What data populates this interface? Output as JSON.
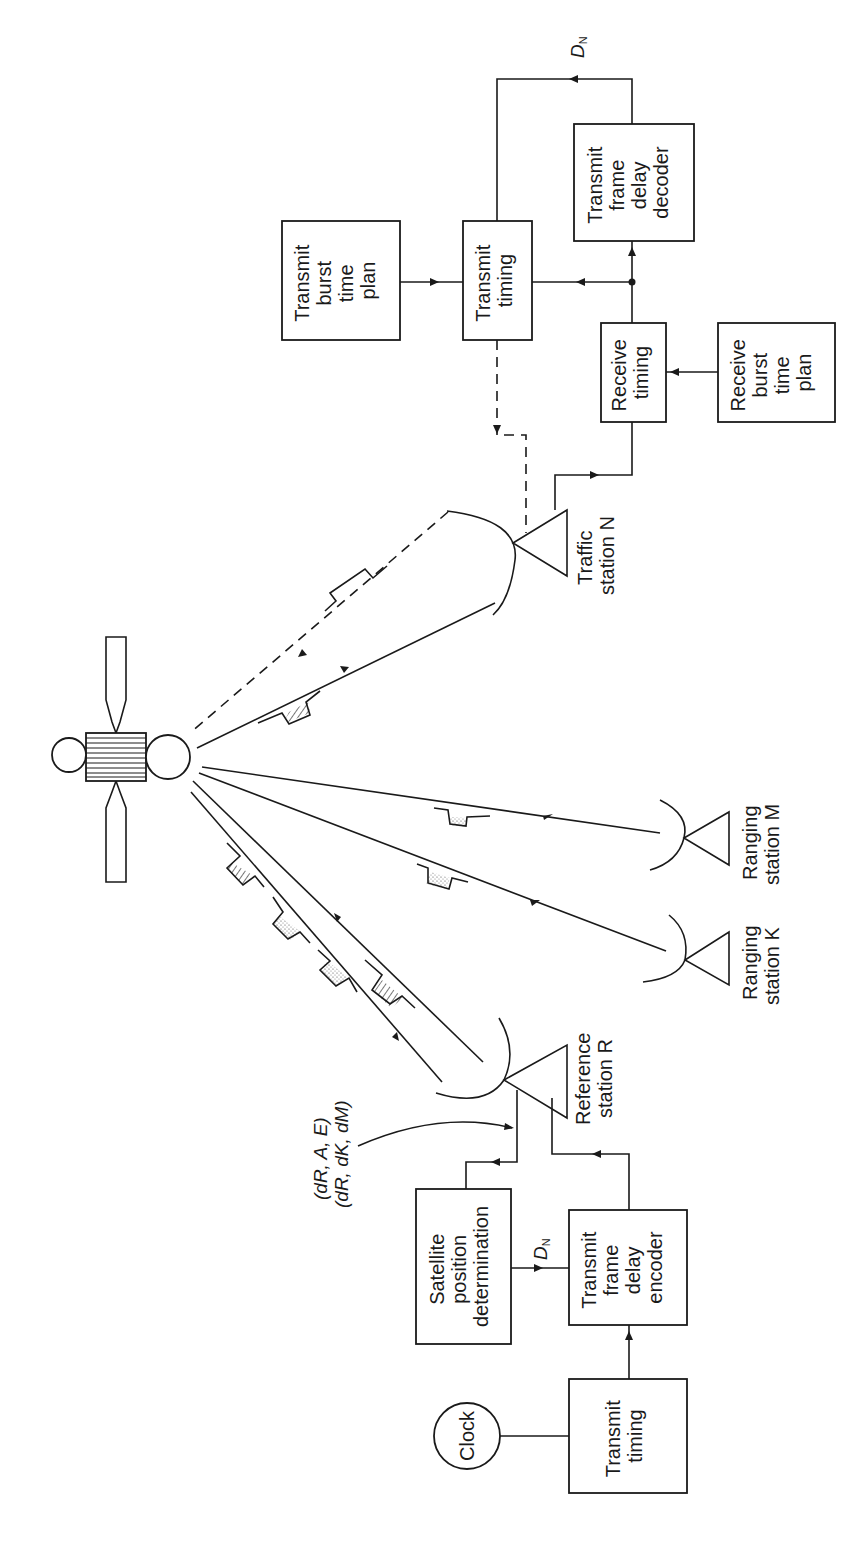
{
  "diagram": {
    "orientation": "rotated 90 degrees counter-clockwise",
    "satellite": {
      "label": ""
    },
    "traffic_station": {
      "label_line1": "Traffic",
      "label_line2": "station N",
      "blocks": {
        "transmit_burst_time_plan": [
          "Transmit",
          "burst",
          "time",
          "plan"
        ],
        "transmit_timing": [
          "Transmit",
          "timing"
        ],
        "transmit_frame_delay_decoder": [
          "Transmit",
          "frame",
          "delay",
          "decoder"
        ],
        "receive_timing": [
          "Receive",
          "timing"
        ],
        "receive_burst_time_plan": [
          "Receive",
          "burst",
          "time",
          "plan"
        ]
      },
      "signal_label": "D",
      "signal_sub": "N"
    },
    "ranging_stations": [
      {
        "label_line1": "Ranging",
        "label_line2": "station M"
      },
      {
        "label_line1": "Ranging",
        "label_line2": "station K"
      }
    ],
    "reference_station": {
      "label_line1": "Reference",
      "label_line2": "station R",
      "blocks": {
        "satellite_position_determination": [
          "Satellite",
          "position",
          "determination"
        ],
        "transmit_frame_delay_encoder": [
          "Transmit",
          "frame",
          "delay",
          "encoder"
        ],
        "transmit_timing": [
          "Transmit",
          "timing"
        ],
        "clock": "Clock"
      },
      "signal_label": "D",
      "signal_sub": "N",
      "annotation_line1": "(dR, A, E)",
      "annotation_line2": "(dR, dK, dM)"
    },
    "colors": {
      "ink": "#1a1a1a",
      "background": "#ffffff"
    }
  }
}
